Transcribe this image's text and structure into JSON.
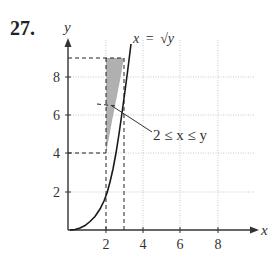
{
  "problem_number": "27.",
  "axes": {
    "x_label": "x",
    "y_label": "y",
    "x_ticks": [
      {
        "value": 2,
        "label": "2"
      },
      {
        "value": 4,
        "label": "4"
      },
      {
        "value": 6,
        "label": "6"
      },
      {
        "value": 8,
        "label": "8"
      }
    ],
    "y_ticks": [
      {
        "value": 2,
        "label": "2"
      },
      {
        "value": 4,
        "label": "4"
      },
      {
        "value": 6,
        "label": "6"
      },
      {
        "value": 8,
        "label": "8"
      }
    ],
    "x_range": [
      0,
      10
    ],
    "y_range": [
      0,
      10
    ],
    "grid": "dotted"
  },
  "curve": {
    "label_lhs": "x",
    "label_eq": "=",
    "label_rhs": "√y",
    "equation": "x = sqrt(y)"
  },
  "region": {
    "label": "2 ≤ x ≤ y",
    "x_bounds": [
      2,
      3
    ],
    "y_bounds": [
      4,
      9
    ],
    "fill": "#b0b0b0"
  },
  "dashed_guides": {
    "x_values": [
      2,
      3
    ],
    "y_values": [
      4,
      9
    ]
  },
  "colors": {
    "axis": "#333333",
    "curve": "#1a1a1a",
    "grid": "#bbbbbb",
    "text": "#333333"
  }
}
